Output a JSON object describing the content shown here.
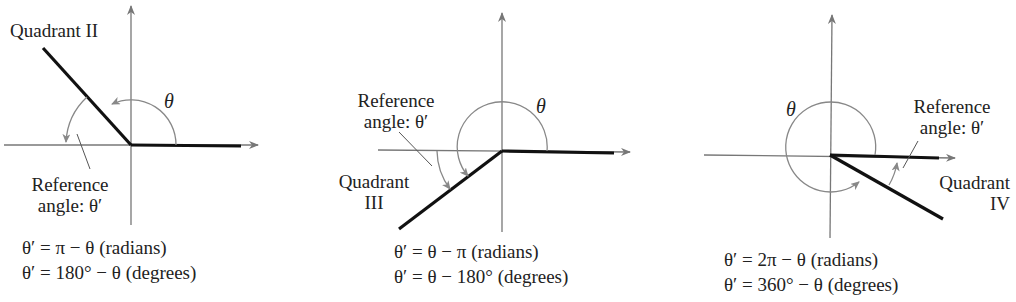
{
  "figure": {
    "panels": [
      {
        "quadrant_label": "Quadrant II",
        "theta_label": "θ",
        "reference_label_line1": "Reference",
        "reference_label_line2": "angle:  θ′",
        "equation_radians": "θ′ = π − θ (radians)",
        "equation_degrees": "θ′ = 180° − θ (degrees)"
      },
      {
        "quadrant_label_line1": "Quadrant",
        "quadrant_label_line2": "III",
        "theta_label": "θ",
        "reference_label_line1": "Reference",
        "reference_label_line2": "angle:  θ′",
        "equation_radians": "θ′ = θ − π (radians)",
        "equation_degrees": "θ′ = θ − 180° (degrees)"
      },
      {
        "quadrant_label_line1": "Quadrant",
        "quadrant_label_line2": "IV",
        "theta_label": "θ",
        "reference_label_line1": "Reference",
        "reference_label_line2": "angle:  θ′",
        "equation_radians": "θ′ = 2π − θ (radians)",
        "equation_degrees": "θ′ = 360° − θ (degrees)"
      }
    ],
    "colors": {
      "axis": "#777777",
      "ray": "#111111",
      "arc": "#888888",
      "text": "#222222"
    }
  }
}
